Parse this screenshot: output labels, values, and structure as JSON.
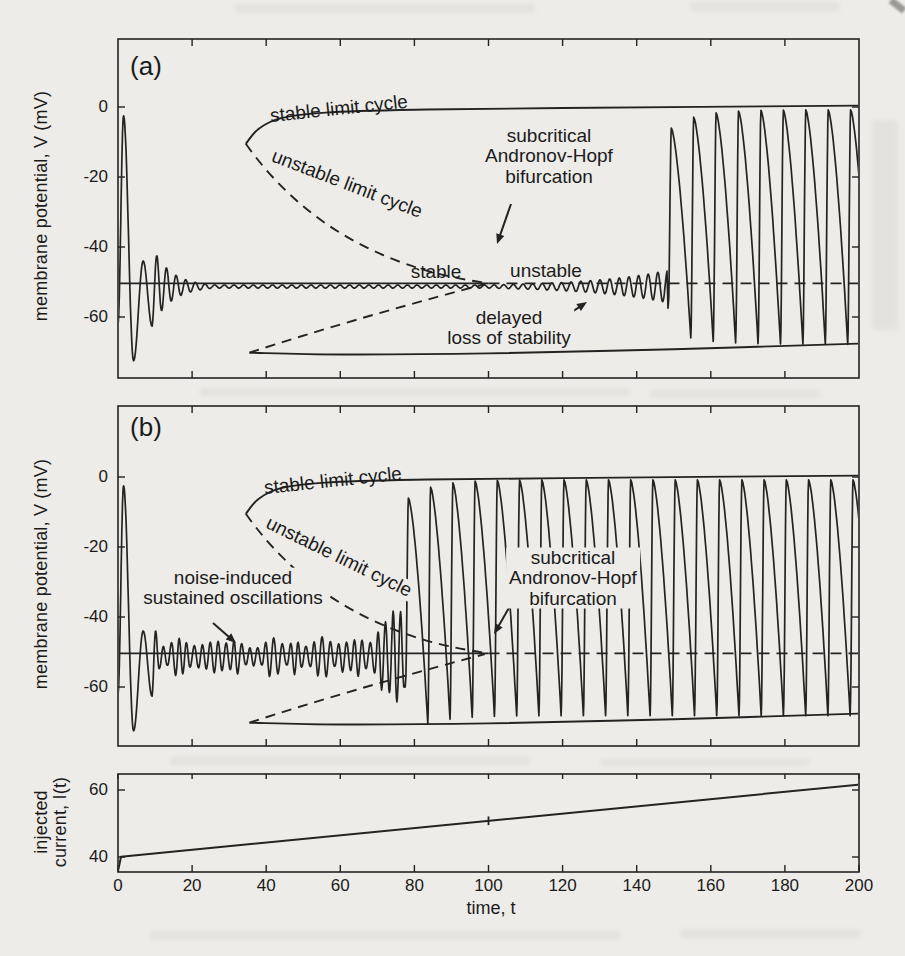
{
  "figure": {
    "kind": "scanned textbook figure, three stacked time-series panels",
    "colors": {
      "paper": "#edece8",
      "ink": "#232323",
      "text": "#1b1b1b"
    }
  },
  "chart_data": [
    {
      "id": "panel-a",
      "type": "line",
      "panel_label": "(a)",
      "ylabel": "membrane potential, V (mV)",
      "xlim": [
        0,
        200
      ],
      "ylim": [
        -77.4,
        19.4
      ],
      "yticks": [
        0,
        -20,
        -40,
        -60
      ],
      "xticks": [
        0,
        20,
        40,
        60,
        80,
        100,
        120,
        140,
        160,
        180,
        200
      ],
      "x_tick_labels_shown": false,
      "grid": false,
      "description": "Noise-free membrane potential under ramped current: damped transient to rest near -51 mV, subcritical Andronov-Hopf bifurcation at t=100, delayed loss of stability, jump to large-amplitude spiking near t=148.",
      "equilibrium": {
        "v": -50.4,
        "stable_range": [
          0,
          100
        ],
        "unstable_range": [
          100,
          200
        ]
      },
      "branches": {
        "upper_stable": [
          [
            34.5,
            -10.5
          ],
          [
            38,
            -6.2
          ],
          [
            44,
            -3.2
          ],
          [
            56,
            -1.6
          ],
          [
            80,
            -0.8
          ],
          [
            120,
            -0.3
          ],
          [
            200,
            0.4
          ]
        ],
        "lower_stable": [
          [
            35.5,
            -70.2
          ],
          [
            60,
            -70.7
          ],
          [
            100,
            -70.4
          ],
          [
            150,
            -69.2
          ],
          [
            200,
            -67.6
          ]
        ],
        "upper_unstable_bezier": [
          [
            34.5,
            -10.5
          ],
          [
            57,
            -44
          ],
          [
            99,
            -50.2
          ]
        ],
        "lower_unstable_bezier": [
          [
            35.5,
            -70.2
          ],
          [
            62,
            -61
          ],
          [
            99,
            -50.6
          ]
        ]
      },
      "trajectory": {
        "v_rest": -51.3,
        "initial_keys": [
          [
            0,
            -62
          ],
          [
            1.5,
            -2.5
          ],
          [
            4.2,
            -72.5
          ],
          [
            6.8,
            -44
          ],
          [
            9.2,
            -62.6
          ]
        ],
        "ringdown": {
          "period": 2.6,
          "amp0": 11.3,
          "tau": 5.2,
          "amp_floor": 0.45
        },
        "growth": {
          "t_start": 100,
          "t_end": 148.2,
          "rate": 0.048
        },
        "burst": {
          "t_start": 148.55,
          "period": 6.05,
          "v_max_first": -6,
          "v_max": -0.8,
          "v_min_first": -66,
          "v_min": -67.8,
          "bridge_v": -57.5
        }
      },
      "annotations": [
        {
          "text": "stable limit cycle",
          "x": 339,
          "y": 109,
          "rot": -6,
          "bg": false
        },
        {
          "text": "unstable limit cycle",
          "x": 347,
          "y": 184,
          "rot": 21,
          "bg": false
        },
        {
          "text": "subcritical\nAndronov-Hopf\nbifurcation",
          "x": 549,
          "y": 156,
          "rot": 0,
          "bg": true
        },
        {
          "text": "stable",
          "x": 436,
          "y": 272,
          "rot": 0,
          "bg": false
        },
        {
          "text": "unstable",
          "x": 546,
          "y": 271,
          "rot": 0,
          "bg": false
        },
        {
          "text": "delayed\nloss of stability",
          "x": 509,
          "y": 328,
          "rot": 0,
          "bg": true
        }
      ],
      "arrows": [
        {
          "x1": 511,
          "y1": 204,
          "x2": 497,
          "y2": 244
        },
        {
          "x1": 558,
          "y1": 321,
          "x2": 587,
          "y2": 302
        }
      ]
    },
    {
      "id": "panel-b",
      "type": "line",
      "panel_label": "(b)",
      "ylabel": "membrane potential, V (mV)",
      "xlim": [
        0,
        200
      ],
      "ylim": [
        -76.9,
        20.3
      ],
      "yticks": [
        0,
        -20,
        -40,
        -60
      ],
      "xticks": [
        0,
        20,
        40,
        60,
        80,
        100,
        120,
        140,
        160,
        180,
        200
      ],
      "x_tick_labels_shown": false,
      "grid": false,
      "description": "Same system with noise: noise-induced sustained oscillations around rest, premature jump to large-amplitude spiking near t=77, before the subcritical Andronov-Hopf bifurcation at t=100.",
      "equilibrium": {
        "v": -50.4,
        "stable_range": [
          0,
          100
        ],
        "unstable_range": [
          100,
          200
        ]
      },
      "branches": {
        "upper_stable": [
          [
            34.5,
            -10.5
          ],
          [
            38,
            -6.2
          ],
          [
            44,
            -3.2
          ],
          [
            56,
            -1.6
          ],
          [
            80,
            -0.8
          ],
          [
            120,
            -0.3
          ],
          [
            200,
            0.4
          ]
        ],
        "lower_stable": [
          [
            35.5,
            -70.2
          ],
          [
            60,
            -70.7
          ],
          [
            100,
            -70.4
          ],
          [
            150,
            -69.2
          ],
          [
            200,
            -67.6
          ]
        ],
        "upper_unstable_bezier": [
          [
            34.5,
            -10.5
          ],
          [
            57,
            -44
          ],
          [
            99,
            -50.2
          ]
        ],
        "lower_unstable_bezier": [
          [
            35.5,
            -70.2
          ],
          [
            62,
            -61
          ],
          [
            99,
            -50.6
          ]
        ]
      },
      "trajectory": {
        "v_rest": -51.3,
        "initial_keys": [
          [
            0,
            -62
          ],
          [
            1.5,
            -2.5
          ],
          [
            4.2,
            -72.5
          ],
          [
            6.8,
            -44
          ],
          [
            9.2,
            -62.6
          ]
        ],
        "noise": {
          "t_end": 76.6,
          "period_base": 1.9,
          "period_jitter": 0.5,
          "amp_base": 2.2,
          "amp_jitter": 3.8,
          "grow_from": 62,
          "grow_rate": 0.075,
          "grow_cap": 3.1,
          "amp_cap": 13,
          "seed": 11
        },
        "burst": {
          "period": 6.0,
          "v_max_first": -6,
          "v_max": -0.8,
          "v_min_first": -70.5,
          "v_min": -68.2,
          "bridge_v": -60
        }
      },
      "annotations": [
        {
          "text": "stable limit cycle",
          "x": 333,
          "y": 481,
          "rot": -6,
          "bg": false
        },
        {
          "text": "unstable limit cycle",
          "x": 339,
          "y": 557,
          "rot": 26,
          "bg": true
        },
        {
          "text": "noise-induced\nsustained oscillations",
          "x": 233,
          "y": 588,
          "rot": 0,
          "bg": true
        },
        {
          "text": "subcritical\nAndronov-Hopf\nbifurcation",
          "x": 573,
          "y": 578,
          "rot": 0,
          "bg": true
        }
      ],
      "arrows": [
        {
          "x1": 213,
          "y1": 623,
          "x2": 236,
          "y2": 643
        },
        {
          "x1": 514,
          "y1": 599,
          "x2": 494,
          "y2": 634
        }
      ]
    },
    {
      "id": "panel-c",
      "type": "line",
      "panel_label": "",
      "ylabel": "injected\ncurrent, I(t)",
      "xlabel": "time, t",
      "xlim": [
        0,
        200
      ],
      "ylim": [
        35.2,
        64.8
      ],
      "yticks": [
        60,
        40
      ],
      "xticks": [
        0,
        20,
        40,
        60,
        80,
        100,
        120,
        140,
        160,
        180,
        200
      ],
      "x_tick_labels_shown": true,
      "grid": false,
      "description": "Injected current ramp: I rises linearly from 40 at t=0 to about 61.5 at t=200; small tick mark on the ramp at t=100 (bifurcation value).",
      "line_points": [
        [
          0,
          35.8
        ],
        [
          0.8,
          40.1
        ],
        [
          200,
          61.6
        ]
      ],
      "ramp_marker": {
        "t": 100,
        "half_height": 1.3
      },
      "annotations": [],
      "arrows": []
    }
  ]
}
